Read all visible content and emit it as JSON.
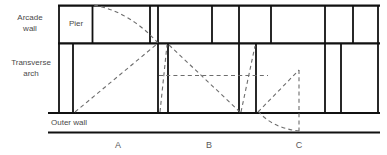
{
  "figure": {
    "type": "architectural-section-diagram",
    "width": 387,
    "height": 155
  },
  "labels": {
    "arcade_wall_line1": "Arcade",
    "arcade_wall_line2": "wall",
    "pier": "Pier",
    "transverse_arch_line1": "Transverse",
    "transverse_arch_line2": "arch",
    "outer_wall": "Outer wall"
  },
  "bays": [
    {
      "letter": "A",
      "x": 118
    },
    {
      "letter": "B",
      "x": 209
    },
    {
      "letter": "C",
      "x": 299
    }
  ],
  "colors": {
    "stroke": "#111111",
    "dashed": "#6d6d6d",
    "text": "#4a4a4a",
    "background": "#ffffff"
  },
  "geometry": {
    "arcade_band": {
      "top_y": 5,
      "bottom_y": 44,
      "left_x": 58,
      "right_x": 379
    },
    "transverse_band": {
      "top_y": 44,
      "bottom_y": 113,
      "left_x": 58,
      "right_x": 379
    },
    "outer_wall_rule": {
      "y": 133,
      "left_x": 48,
      "right_x": 379
    },
    "outer_wall_top_rule": {
      "y": 113,
      "left_x": 48,
      "right_x": 379
    },
    "arcade_verticals": [
      58,
      60,
      92,
      94,
      149,
      151,
      157,
      159,
      211,
      213,
      238,
      240,
      270,
      272,
      324,
      326,
      352,
      354,
      377,
      379
    ],
    "transverse_verticals": [
      58,
      60,
      72,
      74,
      157,
      159,
      167,
      169,
      238,
      240,
      255,
      257,
      324,
      326,
      340,
      342,
      377,
      379
    ],
    "pier_box": {
      "x": 60,
      "y": 5,
      "w": 32,
      "h": 39
    }
  },
  "dashed_elements": {
    "arc_top_left": "curved arc from pier top to arcade-wall springing point",
    "diagonal_rise_left": "rising diagonal from outer wall to arcade springing",
    "diagonal_short_rise": "short rising diagonal to arch crown",
    "diagonal_fall_right": "falling diagonal from arch crown to outer wall",
    "short_rise_right": "short rising diagonal at right pier",
    "horizontal_tie": "horizontal dashed tie line at mid height",
    "triangle_right": "right-hand dashed triangle with vertical drop",
    "arc_bottom_right": "curved arc descending below outer wall"
  }
}
